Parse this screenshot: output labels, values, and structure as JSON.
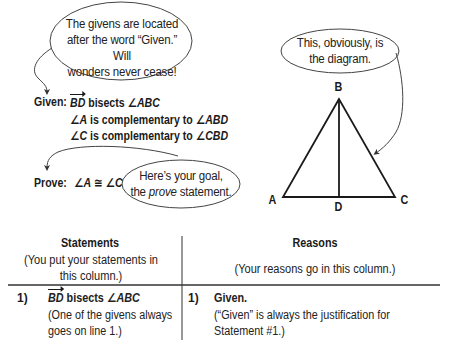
{
  "callouts": {
    "givens_note": {
      "lines": [
        "The givens are located",
        "after the word “Given.” Will",
        "wonders never cease!"
      ]
    },
    "diagram_note": {
      "lines": [
        "This, obviously, is",
        "the diagram."
      ]
    },
    "goal_note": {
      "line1": "Here’s your goal,",
      "line2_prefix": "the ",
      "line2_italic": "prove",
      "line2_suffix": " statement."
    }
  },
  "given": {
    "label": "Given:",
    "statements": [
      {
        "ray": "BD",
        "text": " bisects ",
        "angle": "∠ABC"
      },
      {
        "angle1": "∠A",
        "text": " is complementary to ",
        "angle2": "∠ABD"
      },
      {
        "angle1": "∠C",
        "text": " is complementary to ",
        "angle2": "∠CBD"
      }
    ]
  },
  "prove": {
    "label": "Prove:",
    "statement": "∠A ≅ ∠C"
  },
  "diagram": {
    "vertices": {
      "A": {
        "label": "A",
        "x": 283,
        "y": 197
      },
      "B": {
        "label": "B",
        "x": 339,
        "y": 99
      },
      "C": {
        "label": "C",
        "x": 395,
        "y": 197
      },
      "D": {
        "label": "D",
        "x": 339,
        "y": 197
      }
    },
    "segments": [
      "AB",
      "BC",
      "AC",
      "BD"
    ]
  },
  "table": {
    "columns": [
      {
        "header": "Statements",
        "subheader_lines": [
          "(You put your statements in",
          "this column.)"
        ]
      },
      {
        "header": "Reasons",
        "subheader_lines": [
          "(Your reasons go in this column.)"
        ]
      }
    ],
    "rows": [
      {
        "number": "1)",
        "statement": {
          "ray": "BD",
          "text": " bisects ",
          "angle": "∠ABC",
          "note_lines": [
            "(One of the givens always",
            "goes on line 1.)"
          ]
        },
        "reason": {
          "number": "1)",
          "lead": "Given.",
          "note_lines": [
            "(“Given” is always the justification for",
            "Statement #1.)"
          ]
        }
      }
    ]
  },
  "colors": {
    "ink": "#1a1a1a",
    "callout_stroke": "#444444",
    "background": "#ffffff"
  }
}
